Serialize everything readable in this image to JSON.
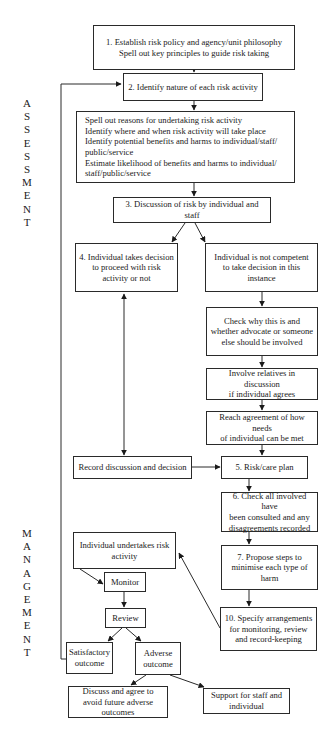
{
  "side_labels": {
    "assessment": [
      "A",
      "S",
      "S",
      "E",
      "S",
      "S",
      "M",
      "E",
      "N",
      "T"
    ],
    "management": [
      "M",
      "A",
      "N",
      "A",
      "G",
      "E",
      "M",
      "E",
      "N",
      "T"
    ]
  },
  "boxes": {
    "step1": "1. Establish risk policy and agency/unit philosophy\nSpell out key principles to guide risk taking",
    "step2": "2. Identify nature of each risk activity",
    "details": "Spell out reasons for undertaking risk activity\nIdentify where and when risk activity will take place\nIdentify potential benefits and harms to individual/staff/\npublic/service\nEstimate likelihood of benefits and harms to individual/\nstaff/public/service",
    "step3": "3. Discussion of risk by individual and staff",
    "step4": "4. Individual takes decision\nto proceed with risk\nactivity or not",
    "not_competent": "Individual is not competent\nto take decision in this\ninstance",
    "check_why": "Check why this is and\nwhether advocate or someone\nelse should be involved",
    "involve_relatives": "Involve relatives in discussion\nif individual agrees",
    "reach_agreement": "Reach agreement of how needs\nof individual can be met",
    "record_discussion": "Record discussion and decision",
    "step5": "5. Risk/care plan",
    "step6": "6. Check all involved have\nbeen consulted and any\ndisagreements recorded",
    "step7": "7. Propose steps to\nminimise each type of\nharm",
    "step10": "10. Specify arrangements\nfor monitoring, review\nand record-keeping",
    "undertakes": "Individual undertakes risk\nactivity",
    "monitor": "Monitor",
    "review": "Review",
    "satisfactory": "Satisfactory\noutcome",
    "adverse": "Adverse\noutcome",
    "discuss_agree": "Discuss and agree to\navoid future adverse\noutcomes",
    "support": "Support for staff and\nindividual"
  },
  "colors": {
    "line": "#2a2a2a",
    "background": "#ffffff"
  }
}
